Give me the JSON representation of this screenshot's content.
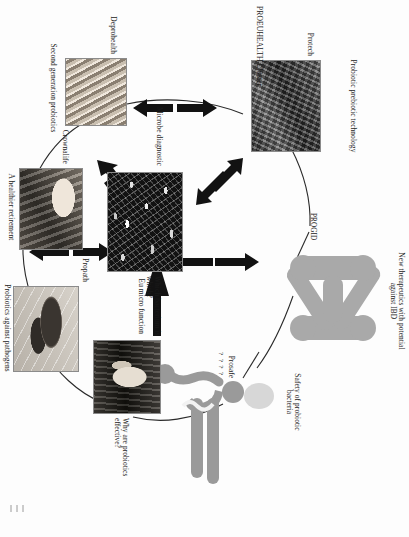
{
  "figure": {
    "title": "PROEUHEALTH Cluster",
    "type": "cluster-diagram"
  },
  "nodes": [
    {
      "id": "protech",
      "project": "Protech",
      "caption": "Probiotic prebiotic technology",
      "image": "laboratory-equipment-photo"
    },
    {
      "id": "progid",
      "project": "PROGID",
      "caption": "New therapeutics with potential against IBD",
      "image": "progid-blob-graphic"
    },
    {
      "id": "prosafe",
      "project": "Prosafe",
      "caption": "Safety of probiotic bacteria",
      "image": "prosafe-figure-graphic",
      "marks": "? ? ? ?"
    },
    {
      "id": "microbe-diagnostic",
      "project": "Microbe diagnostic",
      "caption": "Which bacterium is which?",
      "image": "microscopy-bacteria-photo"
    },
    {
      "id": "eu-micro-function",
      "project": "Eu micro function",
      "caption": "Why are probiotics effective?",
      "image": "anatomy-intestine-photo"
    },
    {
      "id": "deprohealth",
      "project": "Deprohealth",
      "caption": "Second generation probiotics",
      "image": "gut-tissue-photo"
    },
    {
      "id": "crownalife",
      "project": "Crownalife",
      "caption": "A healthier retirement",
      "image": "elderly-person-photo"
    },
    {
      "id": "propath",
      "project": "Propath",
      "caption": "Probiotics against pathogens",
      "image": "bacteria-flagella-photo"
    }
  ],
  "colors": {
    "ink": "#1a1a1a",
    "arrow": "#121212",
    "edge": "#2a2a2a",
    "progid_blob": "#a9a9a9",
    "prosafe_figure": "#9a9a9a",
    "page": "#fdfdfd"
  }
}
